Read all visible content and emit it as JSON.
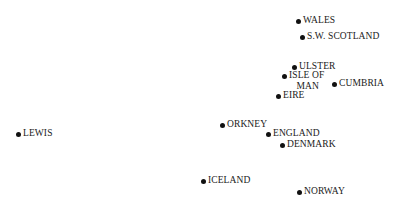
{
  "chart_data": {
    "type": "scatter",
    "title": "",
    "xlabel": "",
    "ylabel": "",
    "grid": false,
    "legend": null,
    "axes_visible": false,
    "points": [
      {
        "label": "WALES",
        "x": 298,
        "y": 21
      },
      {
        "label": "S.W. SCOTLAND",
        "x": 302,
        "y": 37
      },
      {
        "label": "ULSTER",
        "x": 294,
        "y": 67
      },
      {
        "label": "ISLE OF\n   MAN",
        "x": 284,
        "y": 76
      },
      {
        "label": "CUMBRIA",
        "x": 334,
        "y": 84
      },
      {
        "label": "EIRE",
        "x": 278,
        "y": 96
      },
      {
        "label": "LEWIS",
        "x": 18,
        "y": 134
      },
      {
        "label": "ORKNEY",
        "x": 222,
        "y": 125
      },
      {
        "label": "ENGLAND",
        "x": 268,
        "y": 134
      },
      {
        "label": "DENMARK",
        "x": 282,
        "y": 145
      },
      {
        "label": "ICELAND",
        "x": 203,
        "y": 181
      },
      {
        "label": "NORWAY",
        "x": 299,
        "y": 192
      }
    ],
    "colors": {
      "point": "#111111",
      "text": "#1a1a1a",
      "background": "#ffffff"
    }
  }
}
